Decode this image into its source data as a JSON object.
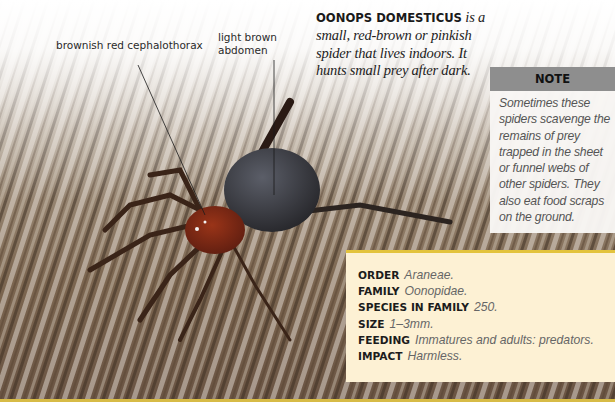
{
  "intro": {
    "species_name": "OONOPS DOMESTICUS",
    "description": " is a small, red-brown or pinkish spider that lives indoors. It hunts small prey after dark."
  },
  "labels": {
    "cephalothorax": "brownish red cephalothorax",
    "abdomen": "light brown abdomen"
  },
  "note": {
    "heading": "NOTE",
    "text": "Sometimes these spiders scavenge the remains of prey trapped in the sheet or funnel webs of other spiders. They also eat food scraps on the ground."
  },
  "facts": [
    {
      "key": "ORDER",
      "value": "Araneae."
    },
    {
      "key": "FAMILY",
      "value": "Oonopidae."
    },
    {
      "key": "SPECIES IN FAMILY",
      "value": "250."
    },
    {
      "key": "SIZE",
      "value": "1–3mm."
    },
    {
      "key": "FEEDING",
      "value": "Immatures and adults: predators."
    },
    {
      "key": "IMPACT",
      "value": "Harmless."
    }
  ],
  "image": {
    "subject": "spider-on-wood-photo"
  },
  "colors": {
    "note_header": "#8e8e8e",
    "fact_box_bg": "#fdf1d4",
    "fact_box_accent": "#e3c33d"
  }
}
